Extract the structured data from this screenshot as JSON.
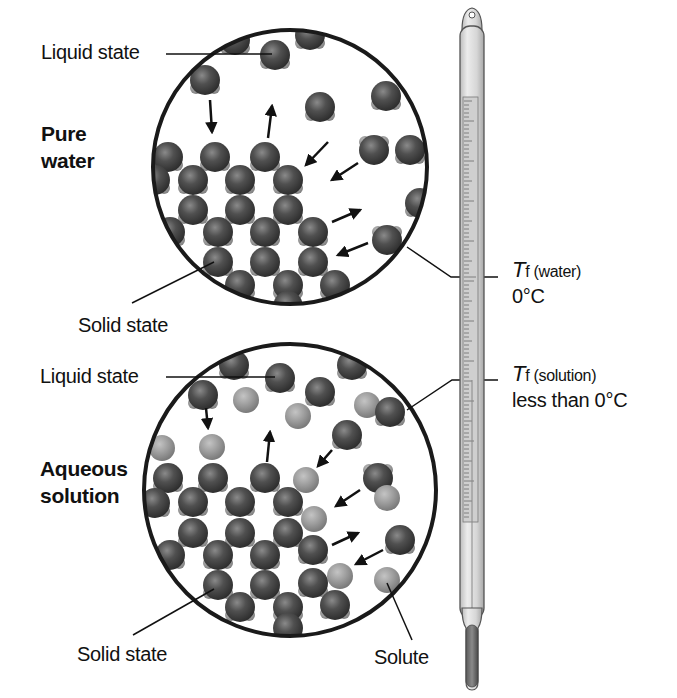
{
  "diagram": {
    "top_panel": {
      "heading_line1": "Pure",
      "heading_line2": "water",
      "liquid_label": "Liquid state",
      "solid_label": "Solid state"
    },
    "bottom_panel": {
      "heading_line1": "Aqueous",
      "heading_line2": "solution",
      "liquid_label": "Liquid state",
      "solid_label": "Solid state",
      "solute_label": "Solute"
    },
    "thermometer": {
      "water_symbol": "T",
      "water_subscript": "f (water)",
      "water_value": "0°C",
      "solution_symbol": "T",
      "solution_subscript": "f (solution)",
      "solution_value": "less than 0°C"
    },
    "colors": {
      "water_molecule": "#4a4a4a",
      "solute_particle": "#9a9a9a",
      "outline": "#1a1a1a",
      "thermometer_glass": "#d8d8d8",
      "mercury": "#6a6a6a"
    }
  }
}
